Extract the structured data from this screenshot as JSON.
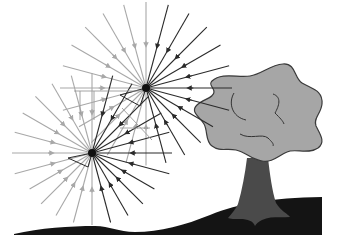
{
  "diagram": {
    "title": "Light rays converging on two viewpoints near a tree",
    "colors": {
      "background": "#ffffff",
      "ray_dark": "#2a2a2a",
      "ray_light": "#a8a8a8",
      "eye": "#111111",
      "tree_crown": "#a6a6a6",
      "tree_crown_outline": "#3a3a3a",
      "tree_trunk": "#4a4a4a",
      "ground": "#141414"
    },
    "viewpoints": [
      {
        "id": "upper",
        "label": "viewpoint-upper"
      },
      {
        "id": "lower",
        "label": "viewpoint-lower"
      }
    ],
    "rays_per_viewpoint": 24,
    "objects": [
      "tree",
      "ground"
    ]
  }
}
